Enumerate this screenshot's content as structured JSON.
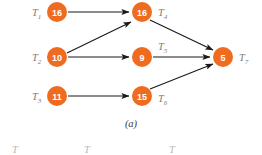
{
  "figure": {
    "caption": "(a)",
    "background_color": "#ffffff",
    "node_color": "#EE6B1F",
    "node_text_color": "#ffffff",
    "label_color": "#7d7d7d",
    "edge_color": "#1a1a1a"
  },
  "nodes": [
    {
      "id": "T1",
      "label": "T",
      "subscript": "1",
      "value": "16",
      "cx": 57,
      "cy": 12,
      "r": 10,
      "label_x": 32,
      "label_y": 16
    },
    {
      "id": "T2",
      "label": "T",
      "subscript": "2",
      "value": "10",
      "cx": 57,
      "cy": 57,
      "r": 10,
      "label_x": 32,
      "label_y": 61
    },
    {
      "id": "T3",
      "label": "T",
      "subscript": "3",
      "value": "11",
      "cx": 57,
      "cy": 96,
      "r": 10,
      "label_x": 32,
      "label_y": 100
    },
    {
      "id": "T4",
      "label": "T",
      "subscript": "4",
      "value": "16",
      "cx": 142,
      "cy": 12,
      "r": 10,
      "label_x": 158,
      "label_y": 16
    },
    {
      "id": "T5",
      "label": "T",
      "subscript": "5",
      "value": "9",
      "cx": 142,
      "cy": 57,
      "r": 10,
      "label_x": 158,
      "label_y": 50
    },
    {
      "id": "T6",
      "label": "T",
      "subscript": "6",
      "value": "15",
      "cx": 142,
      "cy": 96,
      "r": 10,
      "label_x": 158,
      "label_y": 102
    },
    {
      "id": "T7",
      "label": "T",
      "subscript": "7",
      "value": "5",
      "cx": 223,
      "cy": 57,
      "r": 10,
      "label_x": 239,
      "label_y": 61
    }
  ],
  "edges": [
    {
      "id": "T1-T4",
      "from": "T1",
      "to": "T4"
    },
    {
      "id": "T2-T4",
      "from": "T2",
      "to": "T4"
    },
    {
      "id": "T2-T5",
      "from": "T2",
      "to": "T5"
    },
    {
      "id": "T3-T6",
      "from": "T3",
      "to": "T6"
    },
    {
      "id": "T4-T7",
      "from": "T4",
      "to": "T7"
    },
    {
      "id": "T5-T7",
      "from": "T5",
      "to": "T7"
    },
    {
      "id": "T6-T7",
      "from": "T6",
      "to": "T7"
    }
  ],
  "caption": {
    "text": "(a)",
    "x": 131,
    "y": 127
  },
  "next_figure_labels": [
    {
      "text": "T",
      "x": 12,
      "y": 153
    },
    {
      "text": "T",
      "x": 84,
      "y": 153
    },
    {
      "text": "T",
      "x": 169,
      "y": 153
    }
  ]
}
